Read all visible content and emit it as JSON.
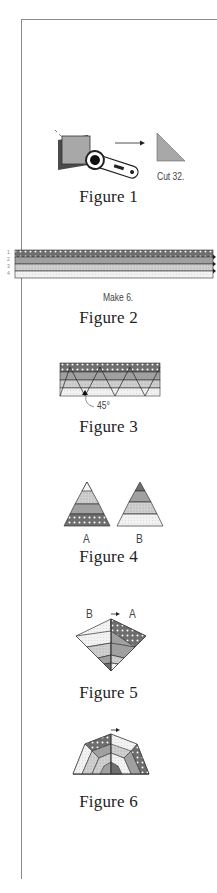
{
  "page": {
    "figures": [
      {
        "id": "figure-1",
        "caption": "Figure 1",
        "note": "Cut 32."
      },
      {
        "id": "figure-2",
        "caption": "Figure 2",
        "note": "Make 6.",
        "strip_labels": [
          "1",
          "2",
          "3",
          "4"
        ]
      },
      {
        "id": "figure-3",
        "caption": "Figure 3",
        "note": "45°"
      },
      {
        "id": "figure-4",
        "caption": "Figure 4",
        "labels": [
          "A",
          "B"
        ]
      },
      {
        "id": "figure-5",
        "caption": "Figure 5",
        "labels": [
          "B",
          "A"
        ]
      },
      {
        "id": "figure-6",
        "caption": "Figure 6"
      }
    ]
  },
  "colors": {
    "border": "#8a8a8a",
    "dark_fabric": "#6e6e6e",
    "medium_fabric": "#a8a8a8",
    "light_fabric": "#d6d6d6",
    "white_fabric": "#f4f4f4"
  }
}
